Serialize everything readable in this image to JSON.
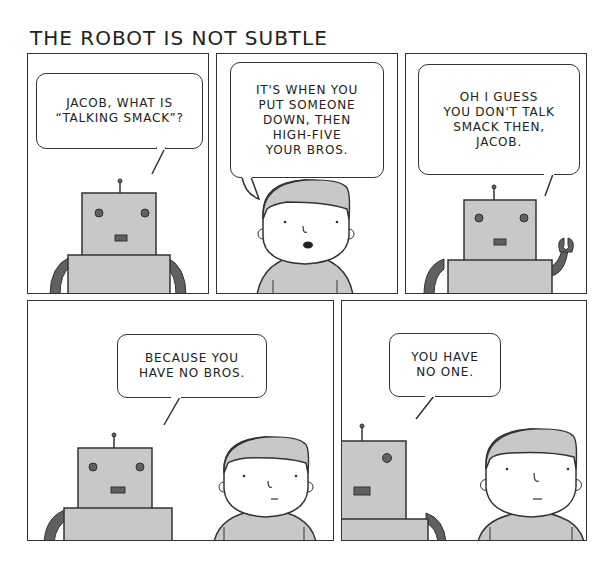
{
  "comic": {
    "title": "THE ROBOT IS NOT SUBTLE",
    "colors": {
      "ink": "#333333",
      "gray_fill": "#c8c8c8",
      "dark_gray": "#606060",
      "background": "#ffffff"
    },
    "panels": [
      {
        "id": 1,
        "speaker": "robot",
        "text": "JACOB, WHAT IS\n“TALKING SMACK”?"
      },
      {
        "id": 2,
        "speaker": "jacob",
        "text": "IT'S WHEN YOU\nPUT SOMEONE\nDOWN, THEN\nHIGH-FIVE\nYOUR BROS."
      },
      {
        "id": 3,
        "speaker": "robot",
        "text": "OH I GUESS\nYOU DON'T TALK\nSMACK THEN,\nJACOB."
      },
      {
        "id": 4,
        "speaker": "robot",
        "text": "BECAUSE YOU\nHAVE NO BROS."
      },
      {
        "id": 5,
        "speaker": "robot",
        "text": "YOU HAVE\nNO ONE."
      }
    ]
  }
}
